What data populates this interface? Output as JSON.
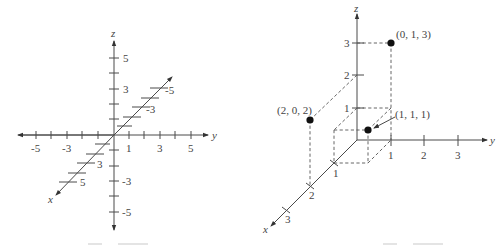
{
  "figures": [
    {
      "id": "left",
      "description": "3D coordinate axes with tick marks from -5 to 5",
      "axes": {
        "x_label": "x",
        "y_label": "y",
        "z_label": "z"
      },
      "y_ticks": [
        "-5",
        "-3",
        "1",
        "3",
        "5"
      ],
      "z_ticks": [
        "5",
        "3",
        "-3",
        "-5"
      ],
      "x_ticks_pos": [
        "3",
        "5"
      ],
      "x_ticks_neg": [
        "-3",
        "-5"
      ]
    },
    {
      "id": "right",
      "description": "Points plotted in 3D coordinate system",
      "axes": {
        "x_label": "x",
        "y_label": "y",
        "z_label": "z"
      },
      "x_ticks": [
        "1",
        "2",
        "3"
      ],
      "y_ticks": [
        "1",
        "2",
        "3"
      ],
      "z_ticks": [
        "1",
        "2",
        "3"
      ],
      "points": [
        {
          "label": "(0, 1, 3)",
          "x": 0,
          "y": 1,
          "z": 3
        },
        {
          "label": "(2, 0, 2)",
          "x": 2,
          "y": 0,
          "z": 2
        },
        {
          "label": "(1, 1, 1)",
          "x": 1,
          "y": 1,
          "z": 1
        }
      ]
    }
  ]
}
